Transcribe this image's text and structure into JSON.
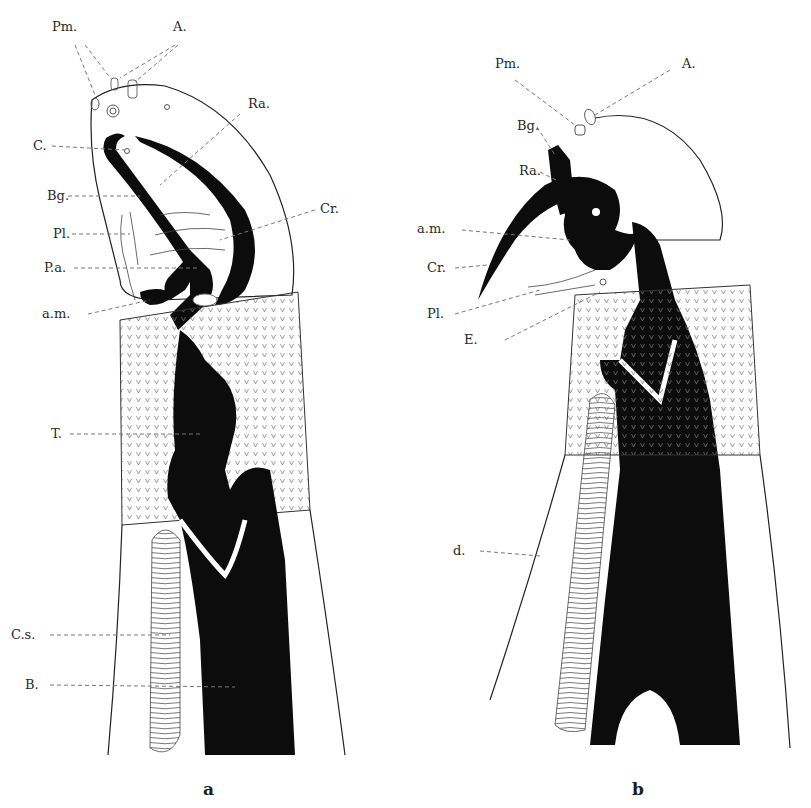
{
  "figure": {
    "type": "anatomical illustration",
    "panels": [
      {
        "id": "a",
        "caption": "a",
        "labels": [
          {
            "text": "Pm.",
            "x": 52,
            "y": 31
          },
          {
            "text": "A.",
            "x": 173,
            "y": 31
          },
          {
            "text": "Ra.",
            "x": 248,
            "y": 104
          },
          {
            "text": "C.",
            "x": 33,
            "y": 150
          },
          {
            "text": "Bg.",
            "x": 47,
            "y": 199
          },
          {
            "text": "Cr.",
            "x": 320,
            "y": 209
          },
          {
            "text": "Pl.",
            "x": 53,
            "y": 236
          },
          {
            "text": "P.a.",
            "x": 44,
            "y": 272
          },
          {
            "text": "a.m.",
            "x": 42,
            "y": 318
          },
          {
            "text": "T.",
            "x": 51,
            "y": 437
          },
          {
            "text": "C.s.",
            "x": 11,
            "y": 638
          },
          {
            "text": "B.",
            "x": 25,
            "y": 688
          }
        ]
      },
      {
        "id": "b",
        "caption": "b",
        "labels": [
          {
            "text": "Pm.",
            "x": 495,
            "y": 65
          },
          {
            "text": "A.",
            "x": 682,
            "y": 65
          },
          {
            "text": "Bg.",
            "x": 517,
            "y": 129
          },
          {
            "text": "Ra.",
            "x": 519,
            "y": 174
          },
          {
            "text": "a.m.",
            "x": 417,
            "y": 232
          },
          {
            "text": "Cr.",
            "x": 427,
            "y": 271
          },
          {
            "text": "Pl.",
            "x": 427,
            "y": 317
          },
          {
            "text": "E.",
            "x": 464,
            "y": 343
          },
          {
            "text": "d.",
            "x": 453,
            "y": 553
          }
        ]
      }
    ]
  },
  "colors": {
    "background": "#ffffff",
    "ink": "#0c0c0c",
    "leader": "#777777"
  }
}
